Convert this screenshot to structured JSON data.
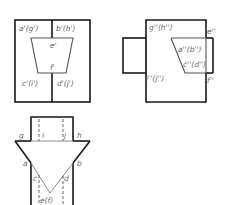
{
  "front_view": {
    "labels": {
      "a_g": "a'(g')",
      "b_h": "b'(h')",
      "e": "e'",
      "f": "f'",
      "c_i": "c'(i')",
      "d_j": "d'(j')"
    }
  },
  "side_view": {
    "labels": {
      "g_h": "g''(h'')",
      "e": "e''",
      "a_b": "a''(b'')",
      "c_d": "c''(d'')",
      "i_j": "i''(j'')",
      "f": "f''"
    }
  },
  "top_view": {
    "labels": {
      "g": "g",
      "i": "i",
      "j": "j",
      "h": "h",
      "a": "a",
      "b": "b",
      "c": "c",
      "d": "d",
      "e_f": "e(f)"
    }
  },
  "colors": {
    "outline": "#1a1a1a",
    "thin_line": "#8a8a8a",
    "label": "#6a6a6a"
  }
}
